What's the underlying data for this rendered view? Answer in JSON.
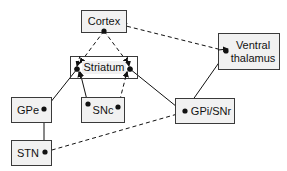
{
  "diagram": {
    "nodes": {
      "cortex": {
        "label": "Cortex"
      },
      "striatum": {
        "label": "Striatum"
      },
      "ventral_thalamus": {
        "label": "Ventral thalamus"
      },
      "gpe": {
        "label": "GPe"
      },
      "snc": {
        "label": "SNc"
      },
      "gpi_snr": {
        "label": "GPi/SNr"
      },
      "stn": {
        "label": "STN"
      }
    },
    "edges": [
      {
        "from": "Cortex",
        "to": "Striatum (left)",
        "style": "dashed"
      },
      {
        "from": "Cortex",
        "to": "Striatum (right)",
        "style": "dashed"
      },
      {
        "from": "Ventral thalamus",
        "to": "Cortex",
        "style": "dashed"
      },
      {
        "from": "Striatum",
        "to": "GPe",
        "style": "solid"
      },
      {
        "from": "Striatum",
        "to": "GPi/SNr",
        "style": "solid"
      },
      {
        "from": "SNc",
        "to": "Striatum (left)",
        "style": "solid"
      },
      {
        "from": "SNc",
        "to": "Striatum (right)",
        "style": "dashed"
      },
      {
        "from": "GPe",
        "to": "STN",
        "style": "solid"
      },
      {
        "from": "STN",
        "to": "GPi/SNr",
        "style": "dashed"
      },
      {
        "from": "GPi/SNr",
        "to": "Ventral thalamus",
        "style": "solid"
      }
    ],
    "colors": {
      "box_fill": "#f1f1f1",
      "box_border": "#3a3a3a",
      "line": "#111111"
    }
  }
}
